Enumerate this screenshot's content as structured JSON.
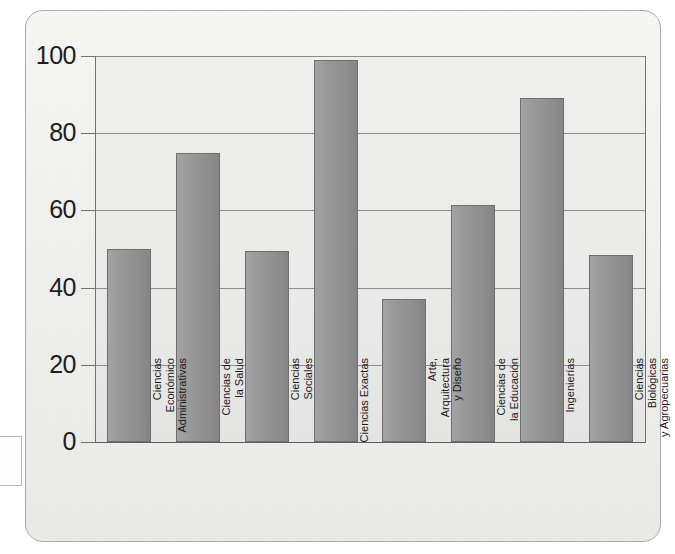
{
  "figure": {
    "frame_style": "rounded-rectangle",
    "background_color": "#f1f1ef",
    "bar_color": "#979797",
    "bar_border_color": "#6e6e6e",
    "grid_color": "#8d8d8d",
    "axis_color": "#5e5e5e"
  },
  "chart_data": {
    "type": "bar",
    "title": "",
    "xlabel": "",
    "ylabel": "",
    "ylim": [
      0,
      100
    ],
    "yticks": [
      "0",
      "20",
      "40",
      "60",
      "80",
      "100"
    ],
    "grid": true,
    "legend": "none",
    "categories": [
      "Ciencias\nEconómico\nAdministrativas",
      "Ciencias de\nla Salud",
      "Ciencias\nSociales",
      "Ciencias Exactas",
      "Arte,\nArquitectura\ny Diseño",
      "Ciencias de\nla Educación",
      "Ingenierías",
      "Ciencias\nBiológicas\ny Agropecuarias"
    ],
    "values": [
      50,
      75,
      49.5,
      99,
      37,
      61.5,
      89,
      48.5
    ]
  }
}
